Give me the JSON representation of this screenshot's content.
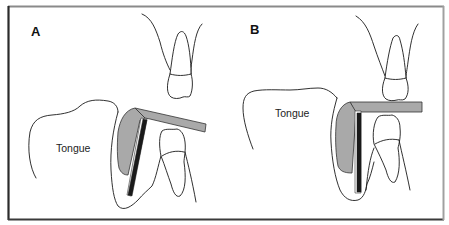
{
  "figure": {
    "panels": [
      {
        "id": "A",
        "label": "A",
        "structure_label": "Tongue"
      },
      {
        "id": "B",
        "label": "B",
        "structure_label": "Tongue"
      }
    ],
    "colors": {
      "frame_dark": "#2b2b2b",
      "frame_light": "#9a9a9a",
      "holder_fill": "#a9a9a9",
      "film": "#1a1a1a",
      "line": "#1a1a1a",
      "background": "#ffffff"
    }
  }
}
